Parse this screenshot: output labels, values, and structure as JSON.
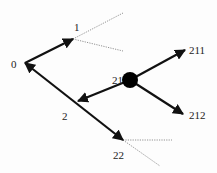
{
  "diagram": {
    "type": "game-tree",
    "colors": {
      "edge": "#111111",
      "dotted": "#777777",
      "node_fill": "#000000",
      "label": "#222222"
    },
    "nodes": [
      {
        "id": "0",
        "label": "0",
        "x": 25,
        "y": 63,
        "lx": 11,
        "ly": 68
      },
      {
        "id": "1",
        "label": "1",
        "x": 73,
        "y": 39,
        "lx": 74,
        "ly": 31
      },
      {
        "id": "2",
        "label": "2",
        "x": 78,
        "y": 101,
        "lx": 62,
        "ly": 120
      },
      {
        "id": "21",
        "label": "21",
        "x": 130,
        "y": 80,
        "lx": 112,
        "ly": 84
      },
      {
        "id": "211",
        "label": "211",
        "x": 185,
        "y": 50,
        "lx": 189,
        "ly": 54
      },
      {
        "id": "212",
        "label": "212",
        "x": 183,
        "y": 114,
        "lx": 189,
        "ly": 119
      },
      {
        "id": "22",
        "label": "22",
        "x": 123,
        "y": 140,
        "lx": 113,
        "ly": 159
      }
    ],
    "edges": [
      {
        "from": "0",
        "to": "1",
        "x1": 25,
        "y1": 63,
        "x2": 73,
        "y2": 39,
        "style": "arrow",
        "arrow_at": "end"
      },
      {
        "from": "22",
        "to": "0",
        "x1": 123,
        "y1": 140,
        "x2": 25,
        "y2": 63,
        "style": "arrow",
        "arrow_at": "both"
      },
      {
        "from": "21",
        "to": "2",
        "x1": 130,
        "y1": 80,
        "x2": 78,
        "y2": 101,
        "style": "arrow",
        "arrow_at": "end"
      },
      {
        "from": "21",
        "to": "211",
        "x1": 130,
        "y1": 80,
        "x2": 185,
        "y2": 50,
        "style": "arrow",
        "arrow_at": "end"
      },
      {
        "from": "21",
        "to": "212",
        "x1": 130,
        "y1": 80,
        "x2": 183,
        "y2": 114,
        "style": "arrow",
        "arrow_at": "end"
      }
    ],
    "dotted_edges": [
      {
        "from": "1",
        "x1": 73,
        "y1": 39,
        "x2": 123,
        "y2": 13
      },
      {
        "from": "1",
        "x1": 73,
        "y1": 39,
        "x2": 123,
        "y2": 51
      },
      {
        "from": "22",
        "x1": 123,
        "y1": 140,
        "x2": 172,
        "y2": 140
      },
      {
        "from": "22",
        "x1": 123,
        "y1": 140,
        "x2": 160,
        "y2": 166
      }
    ],
    "filled_node": {
      "id": "21",
      "cx": 130,
      "cy": 80,
      "r": 8
    }
  }
}
